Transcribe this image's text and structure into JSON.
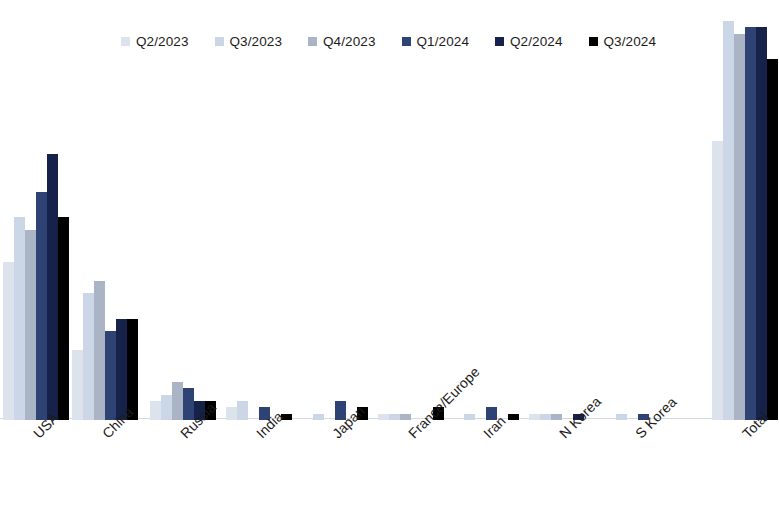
{
  "chart_data": {
    "type": "bar",
    "title": "",
    "subtitle": "",
    "xlabel": "",
    "ylabel": "",
    "grid": false,
    "legend_position": "top",
    "ylim": [
      0,
      70
    ],
    "categories": [
      "USA",
      "China",
      "Russia",
      "India",
      "Japan",
      "France/Europe",
      "Iran",
      "N Korea",
      "S Korea",
      "Total"
    ],
    "series": [
      {
        "name": "Q2/2023",
        "color": "#dde3ec",
        "values": [
          25,
          11,
          3,
          2,
          0,
          1,
          0,
          1,
          0,
          44
        ]
      },
      {
        "name": "Q3/2023",
        "color": "#cbd6e6",
        "values": [
          32,
          20,
          4,
          3,
          1,
          1,
          1,
          1,
          1,
          63
        ]
      },
      {
        "name": "Q4/2023",
        "color": "#aab4c4",
        "values": [
          30,
          22,
          6,
          0,
          0,
          1,
          0,
          1,
          0,
          61
        ]
      },
      {
        "name": "Q1/2024",
        "color": "#2e4374",
        "values": [
          36,
          14,
          5,
          2,
          3,
          0,
          2,
          0,
          1,
          62
        ]
      },
      {
        "name": "Q2/2024",
        "color": "#16224a",
        "values": [
          42,
          16,
          3,
          0,
          0,
          0,
          0,
          1,
          0,
          62
        ]
      },
      {
        "name": "Q3/2024",
        "color": "#000000",
        "values": [
          32,
          16,
          3,
          1,
          2,
          2,
          1,
          0,
          0,
          57
        ]
      }
    ]
  },
  "legend": {
    "entries": [
      {
        "label": "Q2/2023"
      },
      {
        "label": "Q3/2023"
      },
      {
        "label": "Q4/2023"
      },
      {
        "label": "Q1/2024"
      },
      {
        "label": "Q2/2024"
      },
      {
        "label": "Q3/2024"
      }
    ]
  },
  "axis": {
    "category_labels": [
      "USA",
      "China",
      "Russia",
      "India",
      "Japan",
      "France/Europe",
      "Iran",
      "N Korea",
      "S Korea",
      "Total"
    ]
  }
}
